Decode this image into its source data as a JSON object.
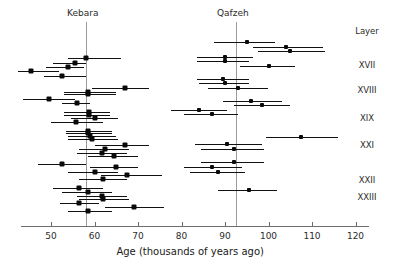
{
  "chart_data": {
    "type": "scatter",
    "title": "",
    "xlabel": "Age (thousands of years ago)",
    "ylabel": "",
    "xlim": [
      43,
      123
    ],
    "xticks": [
      50,
      60,
      70,
      80,
      90,
      100,
      110,
      120
    ],
    "xtick_labels": [
      "50",
      "60",
      "70",
      "80",
      "90",
      "100",
      "110",
      "120"
    ],
    "grid": false,
    "legend": null,
    "annotations": [
      {
        "name": "kebara-site-label",
        "text": "Kebara",
        "x": 58
      },
      {
        "name": "qafzeh-site-label",
        "text": "Qafzeh",
        "x": 92.5
      },
      {
        "name": "layer-column-header",
        "text": "Layer"
      }
    ],
    "reference_lines": [
      {
        "name": "kebara-mean-line",
        "label": "Kebara",
        "x": 58
      },
      {
        "name": "qafzeh-mean-line",
        "label": "Qafzeh",
        "x": 92.5
      }
    ],
    "layer_labels": [
      {
        "label": "XVII",
        "y_px": 65
      },
      {
        "label": "XVIII",
        "y_px": 90
      },
      {
        "label": "XIX",
        "y_px": 118
      },
      {
        "label": "XXI",
        "y_px": 145
      },
      {
        "label": "XXII",
        "y_px": 180
      },
      {
        "label": "XXIII",
        "y_px": 197
      }
    ],
    "series": [
      {
        "name": "Kebara",
        "points": [
          {
            "age": 58.0,
            "low": 53.8,
            "high": 66.0,
            "y_px": 58
          },
          {
            "age": 55.5,
            "low": 50.5,
            "high": 58.0,
            "y_px": 63
          },
          {
            "age": 54.0,
            "low": 48.8,
            "high": 57.5,
            "y_px": 67
          },
          {
            "age": 45.5,
            "low": 42.5,
            "high": 51.8,
            "y_px": 71
          },
          {
            "age": 52.5,
            "low": 48.5,
            "high": 58.0,
            "y_px": 76
          },
          {
            "age": 67.0,
            "low": 59.5,
            "high": 72.5,
            "y_px": 88
          },
          {
            "age": 58.5,
            "low": 53.0,
            "high": 65.0,
            "y_px": 92
          },
          {
            "age": 58.5,
            "low": 53.0,
            "high": 65.0,
            "y_px": 94
          },
          {
            "age": 49.5,
            "low": 43.5,
            "high": 55.5,
            "y_px": 99
          },
          {
            "age": 56.0,
            "low": 52.5,
            "high": 59.0,
            "y_px": 103
          },
          {
            "age": 58.7,
            "low": 53.0,
            "high": 63.5,
            "y_px": 112
          },
          {
            "age": 58.7,
            "low": 53.0,
            "high": 63.5,
            "y_px": 115
          },
          {
            "age": 60.0,
            "low": 54.5,
            "high": 65.5,
            "y_px": 118
          },
          {
            "age": 55.8,
            "low": 50.0,
            "high": 62.0,
            "y_px": 122
          },
          {
            "age": 58.5,
            "low": 53.5,
            "high": 64.0,
            "y_px": 131
          },
          {
            "age": 58.5,
            "low": 53.5,
            "high": 64.0,
            "y_px": 133
          },
          {
            "age": 59.0,
            "low": 54.0,
            "high": 65.0,
            "y_px": 136
          },
          {
            "age": 59.5,
            "low": 54.0,
            "high": 65.5,
            "y_px": 139
          },
          {
            "age": 67.0,
            "low": 60.0,
            "high": 72.5,
            "y_px": 145
          },
          {
            "age": 62.5,
            "low": 56.5,
            "high": 68.0,
            "y_px": 149
          },
          {
            "age": 61.8,
            "low": 56.0,
            "high": 67.5,
            "y_px": 153
          },
          {
            "age": 64.5,
            "low": 58.5,
            "high": 70.0,
            "y_px": 156
          },
          {
            "age": 52.5,
            "low": 47.0,
            "high": 58.0,
            "y_px": 164
          },
          {
            "age": 65.0,
            "low": 59.0,
            "high": 70.0,
            "y_px": 167
          },
          {
            "age": 60.0,
            "low": 54.0,
            "high": 65.5,
            "y_px": 172
          },
          {
            "age": 67.5,
            "low": 61.5,
            "high": 75.5,
            "y_px": 175
          },
          {
            "age": 62.0,
            "low": 56.5,
            "high": 67.5,
            "y_px": 179
          },
          {
            "age": 56.5,
            "low": 50.5,
            "high": 62.0,
            "y_px": 188
          },
          {
            "age": 58.5,
            "low": 52.5,
            "high": 64.0,
            "y_px": 192
          },
          {
            "age": 61.8,
            "low": 56.0,
            "high": 67.5,
            "y_px": 196
          },
          {
            "age": 62.0,
            "low": 56.5,
            "high": 68.0,
            "y_px": 199
          },
          {
            "age": 56.5,
            "low": 52.0,
            "high": 61.0,
            "y_px": 203
          },
          {
            "age": 69.0,
            "low": 62.5,
            "high": 76.0,
            "y_px": 207
          },
          {
            "age": 58.5,
            "low": 54.0,
            "high": 64.0,
            "y_px": 211
          }
        ]
      },
      {
        "name": "Qafzeh",
        "points": [
          {
            "age": 95.0,
            "low": 87.5,
            "high": 101.5,
            "y_px": 42
          },
          {
            "age": 104.0,
            "low": 96.5,
            "high": 112.5,
            "y_px": 47
          },
          {
            "age": 105.0,
            "low": 97.5,
            "high": 113.0,
            "y_px": 51
          },
          {
            "age": 90.0,
            "low": 83.5,
            "high": 96.5,
            "y_px": 57
          },
          {
            "age": 90.0,
            "low": 83.5,
            "high": 95.5,
            "y_px": 61
          },
          {
            "age": 100.0,
            "low": 93.5,
            "high": 106.0,
            "y_px": 66
          },
          {
            "age": 89.5,
            "low": 83.5,
            "high": 95.5,
            "y_px": 79
          },
          {
            "age": 90.0,
            "low": 84.0,
            "high": 95.5,
            "y_px": 83
          },
          {
            "age": 93.0,
            "low": 86.0,
            "high": 100.0,
            "y_px": 88
          },
          {
            "age": 96.0,
            "low": 89.5,
            "high": 103.0,
            "y_px": 101
          },
          {
            "age": 98.5,
            "low": 92.0,
            "high": 105.0,
            "y_px": 105
          },
          {
            "age": 84.0,
            "low": 77.5,
            "high": 90.5,
            "y_px": 110
          },
          {
            "age": 87.0,
            "low": 80.5,
            "high": 93.0,
            "y_px": 114
          },
          {
            "age": 107.5,
            "low": 99.5,
            "high": 116.0,
            "y_px": 137
          },
          {
            "age": 90.5,
            "low": 83.0,
            "high": 98.5,
            "y_px": 144
          },
          {
            "age": 92.0,
            "low": 84.5,
            "high": 99.0,
            "y_px": 149
          },
          {
            "age": 92.0,
            "low": 84.5,
            "high": 99.0,
            "y_px": 162
          },
          {
            "age": 87.0,
            "low": 80.5,
            "high": 94.0,
            "y_px": 167
          },
          {
            "age": 88.5,
            "low": 82.0,
            "high": 94.5,
            "y_px": 172
          },
          {
            "age": 95.5,
            "low": 88.5,
            "high": 102.0,
            "y_px": 190
          }
        ]
      }
    ]
  }
}
